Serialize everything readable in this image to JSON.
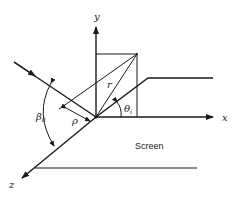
{
  "diagram": {
    "axes": {
      "x_label": "x",
      "y_label": "y",
      "z_label": "z"
    },
    "labels": {
      "r": "r",
      "rho": "ρ",
      "beta": "β",
      "beta_sub": "0",
      "theta": "θ",
      "theta_sub": "i",
      "screen": "Screen"
    },
    "colors": {
      "line": "#1a1a1a",
      "background": "#ffffff"
    }
  }
}
